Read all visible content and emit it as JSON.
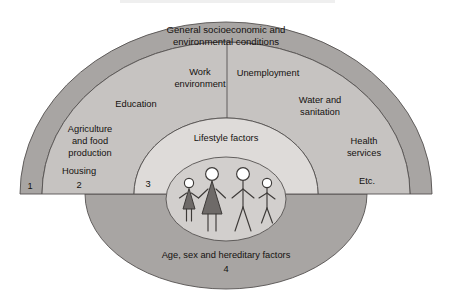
{
  "diagram": {
    "title_text": "General socioeconomic and environmental conditions",
    "type": "rainbow-model",
    "layers": [
      {
        "number": "1",
        "name": "outer-layer",
        "label": "General socioeconomic and environmental conditions",
        "color": "#a8a5a3"
      },
      {
        "number": "2",
        "name": "living-working-conditions-layer",
        "label": "Living and working conditions",
        "color": "#c6c3c1"
      },
      {
        "number": "3",
        "name": "social-community-networks-layer",
        "label": "Social and community networks",
        "color": "#dedbd9"
      },
      {
        "number": "4",
        "name": "constitutional-factors-layer",
        "label": "Age, sex and hereditary factors",
        "color": "#a8a5a3"
      }
    ],
    "outer_band": {
      "line1": "General socioeconomic and",
      "line2": "environmental conditions",
      "number": "1",
      "etc_label": "Etc."
    },
    "middle_band": {
      "work_environment": {
        "line1": "Work",
        "line2": "environment"
      },
      "unemployment": "Unemployment",
      "education": "Education",
      "water_sanitation": {
        "line1": "Water and",
        "line2": "sanitation"
      },
      "agriculture": {
        "line1": "Agriculture",
        "line2": "and food",
        "line3": "production"
      },
      "health_services": {
        "line1": "Health",
        "line2": "services"
      },
      "housing": "Housing",
      "number": "2"
    },
    "inner_band": {
      "lifestyle": "Lifestyle factors",
      "number": "3"
    },
    "base_band": {
      "label": "Age, sex and hereditary factors",
      "number": "4"
    },
    "figures": [
      {
        "name": "figure-girl",
        "sex": "female",
        "size": "small"
      },
      {
        "name": "figure-woman",
        "sex": "female",
        "size": "large"
      },
      {
        "name": "figure-man",
        "sex": "male",
        "size": "large"
      },
      {
        "name": "figure-boy",
        "sex": "male",
        "size": "small"
      }
    ],
    "colors": {
      "band1": "#a8a5a3",
      "band2": "#c6c3c1",
      "band3": "#dedbd9",
      "band4": "#a8a5a3",
      "inner_oval": "#d2cfcd",
      "stroke": "#555150",
      "text": "#14110f",
      "background": "#ffffff"
    }
  }
}
